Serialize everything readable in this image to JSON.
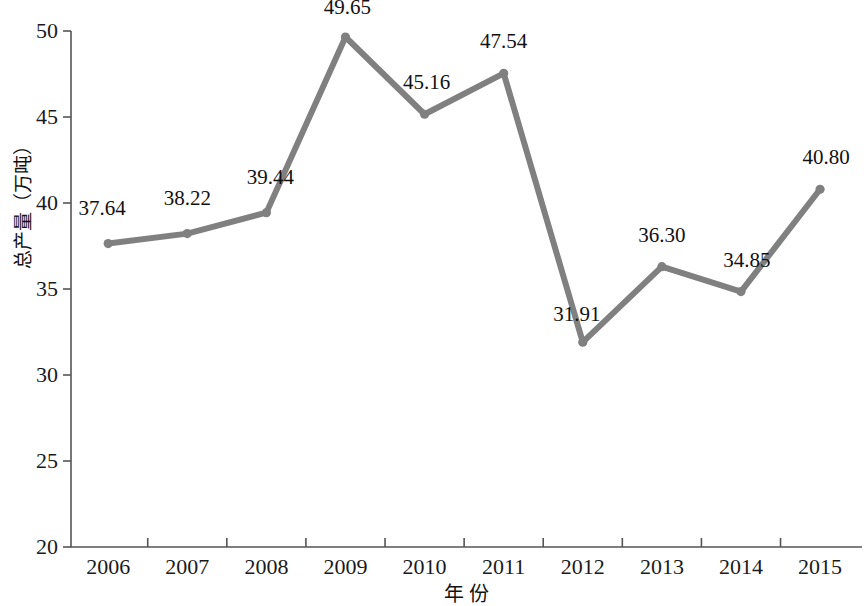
{
  "chart_data": {
    "type": "line",
    "title": "",
    "xlabel": "年 份",
    "ylabel": "总产量（万吨）",
    "categories": [
      "2006",
      "2007",
      "2008",
      "2009",
      "2010",
      "2011",
      "2012",
      "2013",
      "2014",
      "2015"
    ],
    "values": [
      37.64,
      38.22,
      39.44,
      49.65,
      45.16,
      47.54,
      31.91,
      36.3,
      34.85,
      40.8
    ],
    "data_labels": [
      "37.64",
      "38.22",
      "39.44",
      "49.65",
      "45.16",
      "47.54",
      "31.91",
      "36.30",
      "34.85",
      "40.80"
    ],
    "ylim": [
      20,
      50
    ],
    "y_ticks": [
      20,
      25,
      30,
      35,
      40,
      45,
      50
    ],
    "y_tick_labels": [
      "20",
      "25",
      "30",
      "35",
      "40",
      "45",
      "50"
    ],
    "x_tick_labels": [
      "2006",
      "2007",
      "2008",
      "2009",
      "2010",
      "2011",
      "2012",
      "2013",
      "2014",
      "2015"
    ],
    "grid": false,
    "legend": "none",
    "series": [
      {
        "name": "总产量",
        "values": [
          37.64,
          38.22,
          39.44,
          49.65,
          45.16,
          47.54,
          31.91,
          36.3,
          34.85,
          40.8
        ]
      }
    ],
    "colors": {
      "line": "#808080",
      "marker": "#808080",
      "axis": "#555555",
      "text": "#111111",
      "background": "#ffffff"
    }
  }
}
